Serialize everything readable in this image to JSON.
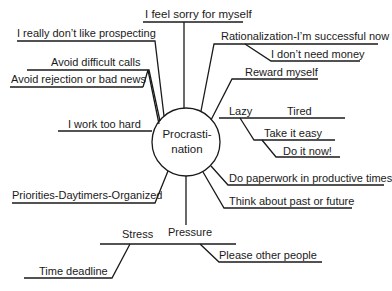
{
  "diagram": {
    "center": {
      "line1": "Procrasti-",
      "line2": "nation"
    },
    "branches": {
      "feel_sorry": "I feel sorry for myself",
      "prospecting": "I really don’t like prospecting",
      "difficult_calls": "Avoid difficult calls",
      "rejection": "Avoid rejection or bad news",
      "work_too_hard": "I work too hard",
      "priorities": "Priorities-Daytimers-Organized",
      "rationalization": "Rationalization-I’m successful now",
      "dont_need_money": "I don’t need money",
      "reward": "Reward myself",
      "lazy": "Lazy",
      "tired": "Tired",
      "take_it_easy": "Take it easy",
      "do_it_now": "Do it now!",
      "paperwork": "Do paperwork in productive times",
      "past_future": "Think about past or future",
      "pressure": "Pressure",
      "stress": "Stress",
      "time_deadline": "Time deadline",
      "please_others": "Please other people"
    }
  }
}
